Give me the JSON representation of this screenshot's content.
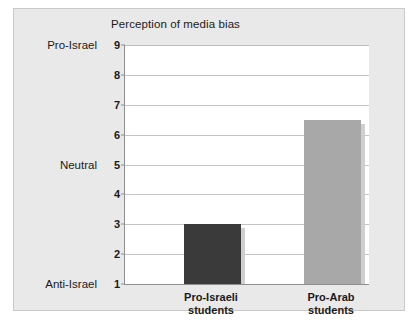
{
  "chart_data": {
    "type": "bar",
    "title": "Perception of media bias",
    "xlabel": "",
    "ylabel": "",
    "categories": [
      "Pro-Israeli students",
      "Pro-Arab students"
    ],
    "category_lines": [
      [
        "Pro-Israeli",
        "students"
      ],
      [
        "Pro-Arab",
        "students"
      ]
    ],
    "values": [
      3,
      6.5
    ],
    "ylim": [
      1,
      9
    ],
    "yticks": [
      1,
      2,
      3,
      4,
      5,
      6,
      7,
      8,
      9
    ],
    "ytick_labels": [
      "1",
      "2",
      "3",
      "4",
      "5",
      "6",
      "7",
      "8",
      "9"
    ],
    "y_scale_labels": [
      {
        "value": 9,
        "label": "Pro-Israel"
      },
      {
        "value": 5,
        "label": "Neutral"
      },
      {
        "value": 1,
        "label": "Anti-Israel"
      }
    ],
    "grid": true,
    "legend": "none",
    "bar_colors": [
      "#3a3a3a",
      "#a8a8a8"
    ]
  },
  "colors": {
    "panel_background": "#e9e9e9",
    "panel_border": "#c9c9c9",
    "plot_background": "#ffffff",
    "gridline": "#c4c4c4",
    "axis": "#8f8f8f",
    "text": "#1a1a1a",
    "bar_one": "#3a3a3a",
    "bar_two": "#a8a8a8",
    "bar_shadow": "#cfcfcf"
  }
}
